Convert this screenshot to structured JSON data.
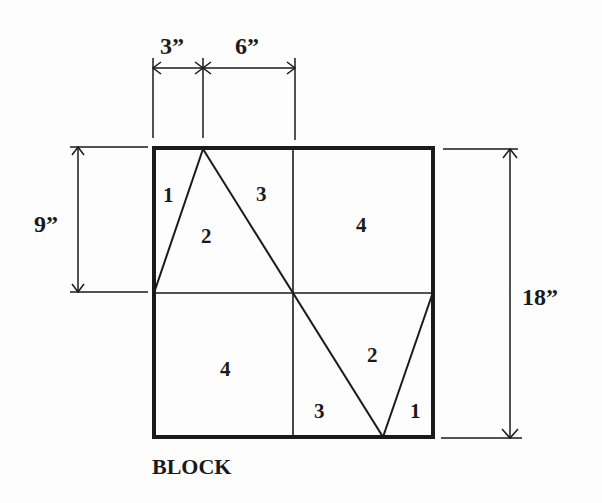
{
  "diagram": {
    "title": "BLOCK",
    "colors": {
      "ink": "#1a1a1a",
      "background": "#fdfdfd"
    },
    "dimensions": {
      "top_left": "3”",
      "top_right": "6”",
      "left": "9”",
      "right": "18”"
    },
    "pieces": {
      "tl_1": "1",
      "tl_2": "2",
      "tl_3": "3",
      "tr_4": "4",
      "bl_4": "4",
      "br_2": "2",
      "br_3": "3",
      "br_1": "1"
    }
  }
}
